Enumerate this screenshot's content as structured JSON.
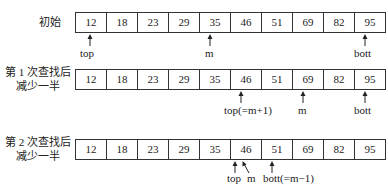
{
  "array_values": [
    "12",
    "18",
    "23",
    "29",
    "35",
    "46",
    "51",
    "69",
    "82",
    "95"
  ],
  "rows": [
    {
      "label_line1": "初始",
      "label_line2": ""
    },
    {
      "label_line1": "第 1 次查找后",
      "label_line2": "减少一半"
    },
    {
      "label_line1": "第 2 次查找后",
      "label_line2": "减少一半"
    }
  ],
  "pointers": {
    "row1": {
      "top": "top",
      "m": "m",
      "bott": "bott"
    },
    "row2": {
      "top": "top(=m+1)",
      "m": "m",
      "bott": "bott"
    },
    "row3": {
      "top": "top",
      "m": "m",
      "bott": "bott(=m−1)"
    }
  }
}
